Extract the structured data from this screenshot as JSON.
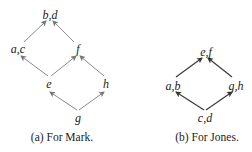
{
  "diagrams": [
    {
      "caption": "(a) For Mark.",
      "nodes": {
        "bd": {
          "label": "b,d"
        },
        "ac": {
          "label": "a,c"
        },
        "f": {
          "label": "f"
        },
        "e": {
          "label": "e"
        },
        "h": {
          "label": "h"
        },
        "g": {
          "label": "g"
        }
      },
      "edges": [
        [
          "ac",
          "bd"
        ],
        [
          "f",
          "bd"
        ],
        [
          "e",
          "ac"
        ],
        [
          "e",
          "f"
        ],
        [
          "h",
          "f"
        ],
        [
          "g",
          "e"
        ],
        [
          "g",
          "h"
        ]
      ]
    },
    {
      "caption": "(b) For Jones.",
      "nodes": {
        "ef": {
          "label": "e,f"
        },
        "ab": {
          "label": "a,b"
        },
        "gh": {
          "label": "g,h"
        },
        "cd": {
          "label": "c,d"
        }
      },
      "edges": [
        [
          "ab",
          "ef"
        ],
        [
          "gh",
          "ef"
        ],
        [
          "cd",
          "ab"
        ],
        [
          "cd",
          "gh"
        ]
      ]
    }
  ]
}
